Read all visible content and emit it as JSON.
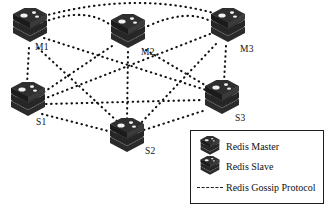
{
  "diagram": {
    "background_color": "#ffffff",
    "node_color": "#2b2b2b",
    "edge_color": "#111111",
    "nodes": [
      {
        "id": "M1",
        "label": "M1",
        "role": "Redis Master",
        "icon": "server-stack-icon",
        "x": 10,
        "y": 8,
        "label_x": 35,
        "label_y": 42
      },
      {
        "id": "M2",
        "label": "M2",
        "role": "Redis Master",
        "icon": "server-stack-icon",
        "x": 108,
        "y": 14,
        "label_x": 141,
        "label_y": 47
      },
      {
        "id": "M3",
        "label": "M3",
        "role": "Redis Master",
        "icon": "server-stack-icon",
        "x": 208,
        "y": 8,
        "label_x": 240,
        "label_y": 44
      },
      {
        "id": "S1",
        "label": "S1",
        "role": "Redis Slave",
        "icon": "server-stack-icon",
        "x": 8,
        "y": 82,
        "label_x": 36,
        "label_y": 117
      },
      {
        "id": "S2",
        "label": "S2",
        "role": "Redis Slave",
        "icon": "server-stack-icon",
        "x": 107,
        "y": 118,
        "label_x": 145,
        "label_y": 146
      },
      {
        "id": "S3",
        "label": "S3",
        "role": "Redis Slave",
        "icon": "server-stack-icon",
        "x": 202,
        "y": 80,
        "label_x": 235,
        "label_y": 113
      }
    ],
    "edges": [
      {
        "from": "M1",
        "to": "M2",
        "style": "dotted",
        "curved": true
      },
      {
        "from": "M1",
        "to": "M3",
        "style": "dotted",
        "curved": true
      },
      {
        "from": "M2",
        "to": "M3",
        "style": "dotted",
        "curved": true
      },
      {
        "from": "M1",
        "to": "S1",
        "style": "dotted",
        "curved": false
      },
      {
        "from": "M1",
        "to": "S2",
        "style": "dotted",
        "curved": false
      },
      {
        "from": "M1",
        "to": "S3",
        "style": "dotted",
        "curved": false
      },
      {
        "from": "M2",
        "to": "S1",
        "style": "dotted",
        "curved": false
      },
      {
        "from": "M2",
        "to": "S2",
        "style": "dotted",
        "curved": false
      },
      {
        "from": "M2",
        "to": "S3",
        "style": "dotted",
        "curved": false
      },
      {
        "from": "M3",
        "to": "S1",
        "style": "dotted",
        "curved": false
      },
      {
        "from": "M3",
        "to": "S2",
        "style": "dotted",
        "curved": false
      },
      {
        "from": "M3",
        "to": "S3",
        "style": "dotted",
        "curved": false
      },
      {
        "from": "S1",
        "to": "S2",
        "style": "dotted",
        "curved": false
      },
      {
        "from": "S1",
        "to": "S3",
        "style": "dotted",
        "curved": false
      },
      {
        "from": "S2",
        "to": "S3",
        "style": "dotted",
        "curved": false
      }
    ]
  },
  "legend": {
    "items": [
      {
        "symbol": "server-stack-icon",
        "label": "Redis Master"
      },
      {
        "symbol": "server-stack-icon",
        "label": "Redis Slave"
      },
      {
        "symbol": "dashed-line-icon",
        "label": "Redis Gossip Protocol"
      }
    ]
  }
}
